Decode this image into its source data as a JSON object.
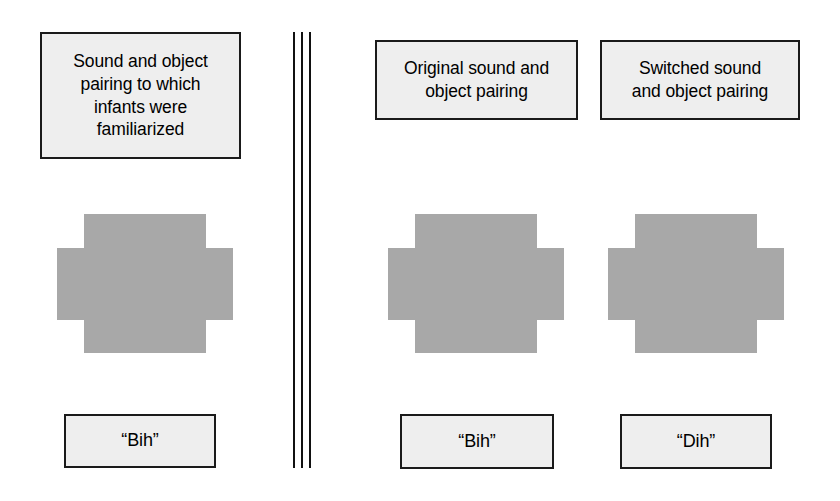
{
  "figure": {
    "background_color": "#ffffff",
    "box_fill_color": "#eeeeee",
    "box_border_color": "#1a1a1a",
    "object_fill_color": "#a8a8a8",
    "divider_color": "#111111"
  },
  "familiarization": {
    "header": "Sound and object\npairing to which\ninfants were\nfamiliarized",
    "object_name": "cross-shaped-object",
    "sound_label": "“Bih”"
  },
  "test": {
    "original": {
      "header": "Original sound and\nobject pairing",
      "object_name": "cross-shaped-object",
      "sound_label": "“Bih”"
    },
    "switched": {
      "header": "Switched sound\nand object pairing",
      "object_name": "cross-shaped-object",
      "sound_label": "“Dih”"
    }
  },
  "divider": {
    "name": "vertical-triple-rule-divider",
    "line_count": 3
  }
}
